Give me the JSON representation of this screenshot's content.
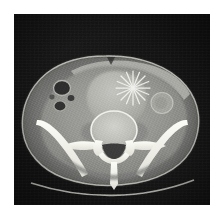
{
  "figure": {
    "modality": "CT",
    "plane": "axial",
    "region": "abdomen/pelvis",
    "caption": "",
    "background_color": "#ffffff",
    "field_color": "#121212",
    "field": {
      "x": 14,
      "y": 14,
      "width": 196,
      "height": 191
    }
  },
  "annotations": {
    "marker": {
      "name": "asterisk-marker",
      "glyph": "*",
      "label": "",
      "color": "#f2f2ee",
      "center_x": 133,
      "center_y": 88,
      "radius": 17,
      "ray_count": 8
    }
  },
  "anatomy": {
    "body_outline": {
      "label": "body contour",
      "fill": "#9a9a98",
      "center_x": 106,
      "center_y": 119,
      "radius_x": 88,
      "radius_y": 63
    },
    "subcutaneous_fat": {
      "label": "subcutaneous fat",
      "fill": "#6f6f6e"
    },
    "structures": [
      {
        "name": "anterior-abdominal-wall",
        "label": "anterior abdominal wall",
        "tone": "#b4b4b0"
      },
      {
        "name": "central-mass",
        "label": "central mass / distended bladder",
        "tone": "#b9b9b4"
      },
      {
        "name": "bowel-loop-left",
        "label": "gas-filled bowel loop",
        "tone": "#2b2b2b"
      },
      {
        "name": "bowel-loop-lower",
        "label": "gas-filled bowel loop",
        "tone": "#303030"
      },
      {
        "name": "round-vessel-right",
        "label": "rounded soft tissue structure",
        "tone": "#a8a8a4"
      },
      {
        "name": "psoas-muscle-left",
        "label": "psoas muscle",
        "tone": "#8d8d8b"
      },
      {
        "name": "psoas-muscle-right",
        "label": "psoas muscle",
        "tone": "#8d8d8b"
      },
      {
        "name": "vertebral-body",
        "label": "vertebral body",
        "tone": "#c6c6c2"
      },
      {
        "name": "spinous-process",
        "label": "spinous process",
        "tone": "#f4f4ef"
      },
      {
        "name": "transverse-process-left",
        "label": "transverse process",
        "tone": "#f4f4ef"
      },
      {
        "name": "transverse-process-right",
        "label": "transverse process",
        "tone": "#f4f4ef"
      },
      {
        "name": "spinal-canal",
        "label": "spinal canal",
        "tone": "#4a4a48"
      },
      {
        "name": "iliac-wing-left",
        "label": "left iliac wing",
        "tone": "#f6f6f1"
      },
      {
        "name": "iliac-wing-right",
        "label": "right iliac wing",
        "tone": "#f6f6f1"
      },
      {
        "name": "gluteal-muscle",
        "label": "gluteal musculature",
        "tone": "#858583"
      }
    ],
    "scanner_table": {
      "name": "scanner-table-line",
      "label": "CT table / couch",
      "tone": "#cfcfc8"
    }
  }
}
